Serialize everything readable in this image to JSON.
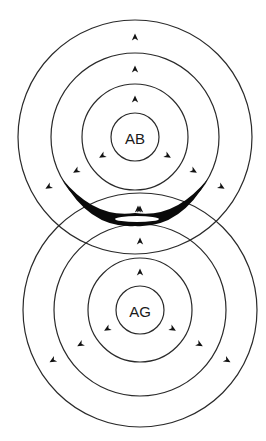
{
  "diagram": {
    "title": "",
    "canvas": {
      "width": 266,
      "height": 441,
      "background": "#ffffff"
    },
    "colors": {
      "stroke": "#2a2a2a",
      "arrow": "#111111",
      "crescent": "#0a0a0a",
      "text": "#1a1a1a"
    },
    "systems": [
      {
        "id": "ab",
        "label": "AB",
        "center": {
          "x": 135,
          "y": 137
        },
        "radii": [
          24,
          53,
          84,
          117
        ],
        "arrow_directions_deg": [
          -90,
          150,
          30
        ],
        "arrow_radii": [
          38,
          68,
          100
        ]
      },
      {
        "id": "ag",
        "label": "AG",
        "center": {
          "x": 140,
          "y": 310
        },
        "radii": [
          24,
          52,
          86,
          117
        ],
        "arrow_directions_deg": [
          -90,
          150,
          30
        ],
        "arrow_radii": [
          38,
          69,
          101
        ]
      }
    ],
    "interaction_zone": {
      "description": "thick black crescent where the two ring systems meet",
      "arrow_at_contact": true
    }
  }
}
